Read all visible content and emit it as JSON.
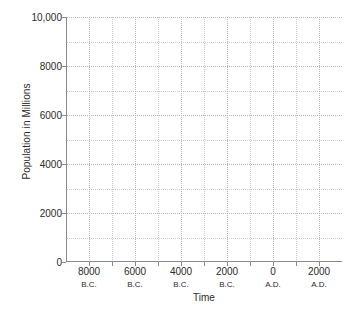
{
  "chart_data": {
    "type": "line",
    "title": "",
    "xlabel": "Time",
    "ylabel": "Population in Millions",
    "xlim": [
      -9000,
      3000
    ],
    "ylim": [
      0,
      10000
    ],
    "grid": true,
    "legend": false,
    "series": [],
    "note": "Empty plot grid with no data series drawn",
    "y_ticks": [
      {
        "value": 10000,
        "label": "10,000",
        "major": true
      },
      {
        "value": 9000,
        "label": "",
        "major": false
      },
      {
        "value": 8000,
        "label": "8000",
        "major": true
      },
      {
        "value": 7000,
        "label": "",
        "major": false
      },
      {
        "value": 6000,
        "label": "6000",
        "major": true
      },
      {
        "value": 5000,
        "label": "",
        "major": false
      },
      {
        "value": 4000,
        "label": "4000",
        "major": true
      },
      {
        "value": 3000,
        "label": "",
        "major": false
      },
      {
        "value": 2000,
        "label": "2000",
        "major": true
      },
      {
        "value": 1000,
        "label": "",
        "major": false
      },
      {
        "value": 0,
        "label": "0",
        "major": true
      }
    ],
    "x_ticks": [
      {
        "value": -8000,
        "label": "8000",
        "era": "B.C.",
        "major": true
      },
      {
        "value": -7000,
        "label": "",
        "era": "",
        "major": false
      },
      {
        "value": -6000,
        "label": "6000",
        "era": "B.C.",
        "major": true
      },
      {
        "value": -5000,
        "label": "",
        "era": "",
        "major": false
      },
      {
        "value": -4000,
        "label": "4000",
        "era": "B.C.",
        "major": true
      },
      {
        "value": -3000,
        "label": "",
        "era": "",
        "major": false
      },
      {
        "value": -2000,
        "label": "2000",
        "era": "B.C.",
        "major": true
      },
      {
        "value": -1000,
        "label": "",
        "era": "",
        "major": false
      },
      {
        "value": 0,
        "label": "0",
        "era": "A.D.",
        "major": true
      },
      {
        "value": 1000,
        "label": "",
        "era": "",
        "major": false
      },
      {
        "value": 2000,
        "label": "2000",
        "era": "A.D.",
        "major": true
      }
    ]
  },
  "colors": {
    "background": "#ffffff",
    "axis": "#8a8a8a",
    "grid_major": "#b9b9b9",
    "grid_minor": "#c9c9c9",
    "text": "#2b2b2b"
  }
}
